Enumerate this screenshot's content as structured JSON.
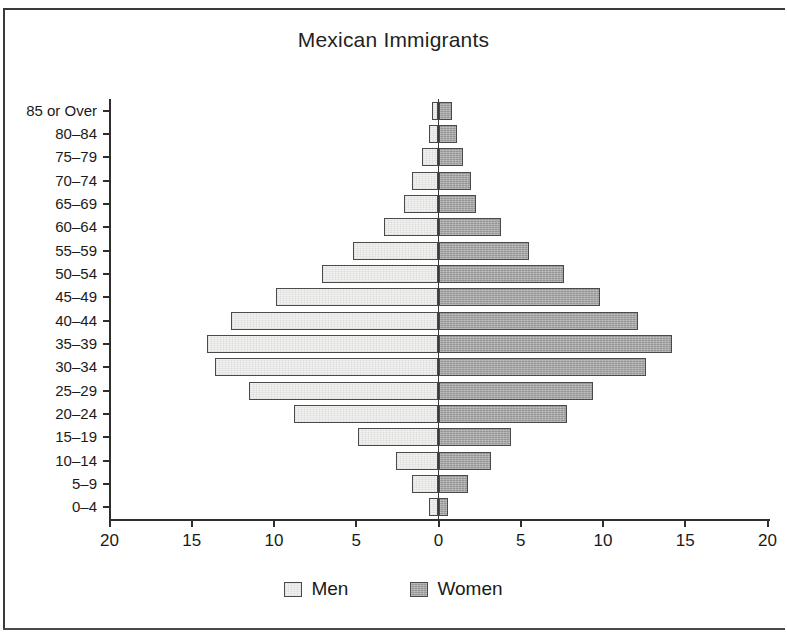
{
  "chart_data": {
    "type": "bar",
    "subtype": "population-pyramid",
    "title": "Mexican Immigrants",
    "xlabel": "",
    "ylabel": "",
    "xlim": [
      -20,
      20
    ],
    "xticks": [
      20,
      15,
      10,
      5,
      0,
      5,
      10,
      15,
      20
    ],
    "xtick_labels": [
      "20",
      "15",
      "10",
      "5",
      "0",
      "5",
      "10",
      "15",
      "20"
    ],
    "grid": false,
    "legend_position": "bottom",
    "categories": [
      "85 or Over",
      "80–84",
      "75–79",
      "70–74",
      "65–69",
      "60–64",
      "55–59",
      "50–54",
      "45–49",
      "40–44",
      "35–39",
      "30–34",
      "25–29",
      "20–24",
      "15–19",
      "10–14",
      "5–9",
      "0–4"
    ],
    "series": [
      {
        "name": "Men",
        "direction": "left",
        "color": "#f2f2f0",
        "values": [
          0.4,
          0.6,
          1.0,
          1.6,
          2.1,
          3.3,
          5.2,
          7.1,
          9.9,
          12.6,
          14.1,
          13.6,
          11.5,
          8.8,
          4.9,
          2.6,
          1.6,
          0.6
        ]
      },
      {
        "name": "Women",
        "direction": "right",
        "color": "#a9a9a9",
        "values": [
          0.8,
          1.1,
          1.5,
          2.0,
          2.3,
          3.8,
          5.5,
          7.6,
          9.8,
          12.1,
          14.2,
          12.6,
          9.4,
          7.8,
          4.4,
          3.2,
          1.8,
          0.6
        ]
      }
    ]
  },
  "legend": {
    "items": [
      {
        "label": "Men",
        "color": "#f2f2f0"
      },
      {
        "label": "Women",
        "color": "#a9a9a9"
      }
    ]
  }
}
